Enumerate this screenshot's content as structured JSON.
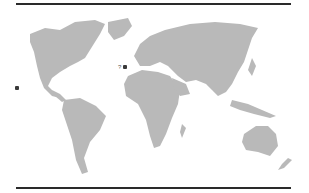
{
  "map": {
    "type": "world-map",
    "land_color": "#b9b9b9",
    "rule_color": "#2a2a2a",
    "markers": [
      {
        "id": "atlantic-marker",
        "label": "?",
        "x": 123,
        "y": 67
      },
      {
        "id": "pacific-marker",
        "label": "",
        "x": 16,
        "y": 87
      }
    ]
  }
}
